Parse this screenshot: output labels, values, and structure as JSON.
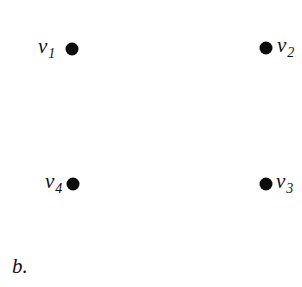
{
  "diagram": {
    "type": "graph",
    "caption": "b.",
    "vertices": [
      {
        "id": "v1",
        "name": "v",
        "subscript": "1",
        "x": 72,
        "y": 49,
        "label_side": "left"
      },
      {
        "id": "v2",
        "name": "v",
        "subscript": "2",
        "x": 266,
        "y": 48,
        "label_side": "right"
      },
      {
        "id": "v3",
        "name": "v",
        "subscript": "3",
        "x": 266,
        "y": 184,
        "label_side": "right"
      },
      {
        "id": "v4",
        "name": "v",
        "subscript": "4",
        "x": 73,
        "y": 184,
        "label_side": "left"
      }
    ],
    "edges": [],
    "colors": {
      "background": "#ffffff",
      "vertex": "#0d0d0d",
      "text": "#111111"
    }
  }
}
